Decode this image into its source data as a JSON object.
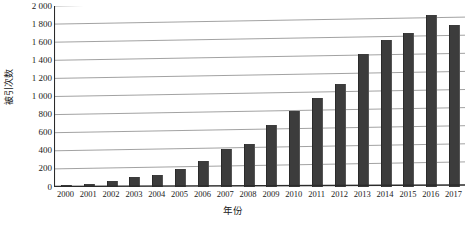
{
  "chart_data": {
    "type": "bar",
    "title": "",
    "xlabel": "年份",
    "ylabel": "被引次数",
    "categories": [
      "2000",
      "2001",
      "2002",
      "2003",
      "2004",
      "2005",
      "2006",
      "2007",
      "2008",
      "2009",
      "2010",
      "2011",
      "2012",
      "2013",
      "2014",
      "2015",
      "2016",
      "2017"
    ],
    "values": [
      20,
      30,
      70,
      110,
      130,
      195,
      290,
      415,
      480,
      690,
      845,
      985,
      1140,
      1470,
      1620,
      1705,
      1905,
      1790
    ],
    "series": [
      {
        "name": "被引次数",
        "values": [
          20,
          30,
          70,
          110,
          130,
          195,
          290,
          415,
          480,
          690,
          845,
          985,
          1140,
          1470,
          1620,
          1705,
          1905,
          1790
        ]
      }
    ],
    "ylim": [
      0,
      2000
    ],
    "ytick_labels": [
      "0",
      "200",
      "400",
      "600",
      "800",
      "1 000",
      "1 200",
      "1 400",
      "1 600",
      "1 800",
      "2 000"
    ],
    "ytick_values": [
      0,
      200,
      400,
      600,
      800,
      1000,
      1200,
      1400,
      1600,
      1800,
      2000
    ],
    "grid": true,
    "grid_axis": "y",
    "legend": false,
    "legend_position": "none",
    "bar_color": "#3c3c3c",
    "grid_color": "#8a8a8a",
    "axis_color": "#2b2b2b",
    "background": "#ffffff"
  }
}
